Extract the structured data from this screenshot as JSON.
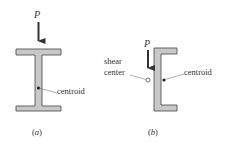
{
  "figure": {
    "panel_a": {
      "label": "(a)",
      "section": "I-beam",
      "load_label": "P",
      "centroid_label": "centroid"
    },
    "panel_b": {
      "label": "(b)",
      "section": "channel",
      "load_label": "P",
      "shear_center_label_line1": "shear",
      "shear_center_label_line2": "center",
      "centroid_label": "centroid"
    },
    "colors": {
      "section_fill": "#c8c8c8",
      "section_stroke": "#555555",
      "arrow": "#333333",
      "text": "#333333"
    }
  }
}
